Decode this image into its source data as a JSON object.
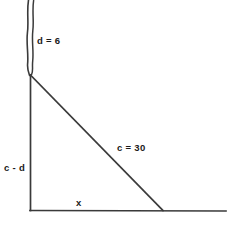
{
  "diagram": {
    "stroke_color": "#3a3a3a",
    "label_color": "#1a1a1a",
    "background_color": "#ffffff",
    "labels": {
      "break_segment": "d = 6",
      "vertical_leg": "c - d",
      "hypotenuse": "c = 30",
      "horizontal_leg": "x"
    },
    "geometry": {
      "apex": [
        30,
        75
      ],
      "corner": [
        30,
        210
      ],
      "foot": [
        163,
        210
      ],
      "baseline_end": [
        226,
        211
      ],
      "break_top": [
        29,
        0
      ]
    }
  }
}
